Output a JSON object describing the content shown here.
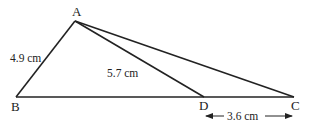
{
  "diagram": {
    "type": "triangle-with-cevian",
    "colors": {
      "stroke": "#222222",
      "background": "#ffffff"
    },
    "points": {
      "A": {
        "label": "A",
        "x": 75,
        "y": 21
      },
      "B": {
        "label": "B",
        "x": 16,
        "y": 97
      },
      "D": {
        "label": "D",
        "x": 204,
        "y": 97
      },
      "C": {
        "label": "C",
        "x": 294,
        "y": 97
      }
    },
    "segments": [
      {
        "from": "A",
        "to": "B"
      },
      {
        "from": "A",
        "to": "C"
      },
      {
        "from": "A",
        "to": "D"
      },
      {
        "from": "B",
        "to": "C"
      }
    ],
    "measurements": {
      "AB": "4.9 cm",
      "AD": "5.7 cm",
      "DC": "3.6 cm"
    }
  }
}
